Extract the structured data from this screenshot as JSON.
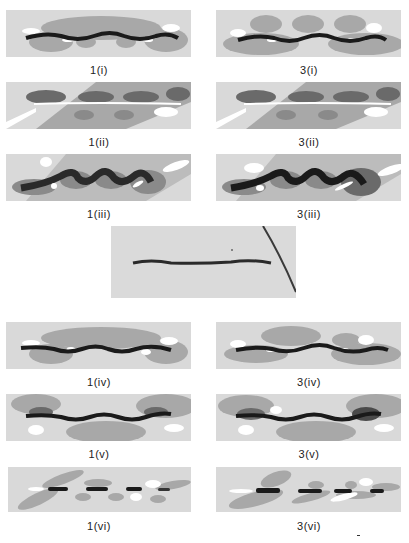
{
  "figure": {
    "panels_left": [
      {
        "label": "1(i)"
      },
      {
        "label": "1(ii)"
      },
      {
        "label": "1(iii)"
      },
      {
        "label": "1(iv)"
      },
      {
        "label": "1(v)"
      },
      {
        "label": "1(vi)"
      }
    ],
    "panels_right": [
      {
        "label": "3(i)"
      },
      {
        "label": "3(ii)"
      },
      {
        "label": "3(iii)"
      },
      {
        "label": "3(iv)"
      },
      {
        "label": "3(v)"
      },
      {
        "label": "3(vi)"
      }
    ],
    "center_photo": {
      "description": "photograph of wavy dark filament"
    },
    "colors": {
      "background": "#ffffff",
      "field": "#d9d9d9",
      "mid_contour": "#a8a8a8",
      "dark_contour": "#6a6a6a",
      "core": "#1a1a1a",
      "highlight": "#ffffff"
    }
  }
}
